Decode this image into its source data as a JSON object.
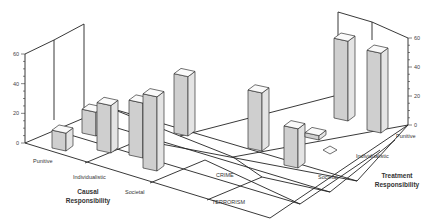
{
  "chart_data": {
    "type": "bar",
    "subtype": "3d-bar",
    "title": "",
    "panels": [
      "CRIME",
      "TERRORISM"
    ],
    "left_axis": {
      "title": "Causal Responsibility",
      "categories": [
        "Punitive",
        "Individualistic",
        "Societal"
      ]
    },
    "right_axis": {
      "title": "Treatment Responsibility",
      "categories": [
        "Punitive",
        "Individualistic",
        "Societal"
      ]
    },
    "zlim": [
      0,
      60
    ],
    "zticks": [
      "0",
      "20",
      "40",
      "60"
    ],
    "series": [
      {
        "name": "CRIME",
        "values": [
          {
            "causal": "Punitive",
            "value": 12
          },
          {
            "causal": "Individualistic",
            "value": 16
          },
          {
            "causal": "Individualistic",
            "value": 32
          },
          {
            "causal": "Societal",
            "value": 37
          },
          {
            "causal": "Societal",
            "value": 50
          },
          {
            "causal": "Societal",
            "value": 40
          }
        ]
      },
      {
        "name": "TERRORISM",
        "values": [
          {
            "treatment": "Punitive",
            "value": 55
          },
          {
            "treatment": "Punitive",
            "value": 55
          },
          {
            "treatment": "Individualistic",
            "value": 0.5
          },
          {
            "treatment": "Societal",
            "value": 40
          },
          {
            "treatment": "Societal",
            "value": 27
          },
          {
            "treatment": "Societal",
            "value": 3
          }
        ]
      }
    ],
    "labels": {
      "crime": "CRIME",
      "terrorism": "TERRORISM",
      "causal_title_1": "Causal",
      "causal_title_2": "Responsibility",
      "treatment_title_1": "Treatment",
      "treatment_title_2": "Responsibility"
    }
  }
}
